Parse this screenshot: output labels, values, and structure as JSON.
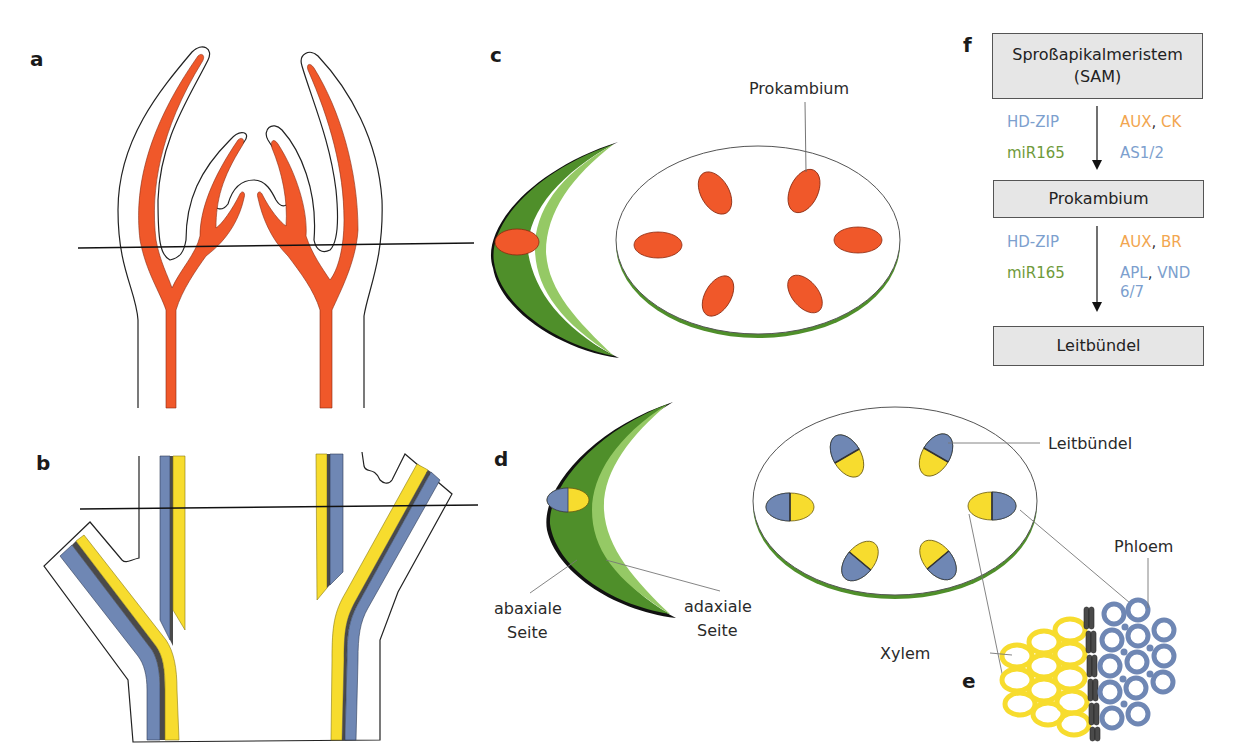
{
  "panels": {
    "a": {
      "letter": "a"
    },
    "b": {
      "letter": "b"
    },
    "c": {
      "letter": "c",
      "label_prokambium": "Prokambium"
    },
    "d": {
      "letter": "d",
      "label_abaxial_1": "abaxiale",
      "label_abaxial_2": "Seite",
      "label_adaxial_1": "adaxiale",
      "label_adaxial_2": "Seite",
      "label_leitbuendel": "Leitbündel"
    },
    "e": {
      "letter": "e",
      "label_xylem": "Xylem",
      "label_phloem": "Phloem"
    },
    "f": {
      "letter": "f",
      "box1_line1": "Sproßapikalmeristem",
      "box1_line2": "(SAM)",
      "step1": {
        "left1": "HD-ZIP",
        "left2": "miR165",
        "right1a": "AUX",
        "right1sep": ", ",
        "right1b": "CK",
        "right2": "AS1/2"
      },
      "box2": "Prokambium",
      "step2": {
        "left1": "HD-ZIP",
        "left2": "miR165",
        "right1a": "AUX",
        "right1sep": ", ",
        "right1b": "BR",
        "right2a": "APL",
        "right2sep": ", ",
        "right2b": "VND",
        "right3": "6/7"
      },
      "box3": "Leitbündel"
    }
  },
  "colors": {
    "prokambium_orange": "#f0582a",
    "xylem_yellow": "#f7dc2e",
    "phloem_blue": "#6f87b4",
    "cambium_gray": "#4a4a4a",
    "leaf_dark_green": "#4f8f2a",
    "leaf_light_green": "#95c965",
    "hd_zip_blue": "#7d9fce",
    "mir165_green": "#6f9a3a",
    "hormone_orange": "#f2a650",
    "box_gray": "#e6e6e6"
  }
}
